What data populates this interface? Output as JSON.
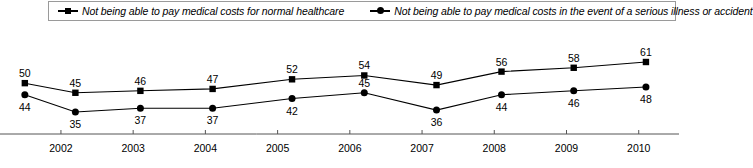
{
  "legend": {
    "entries": [
      {
        "label": "Not being able to pay medical costs for normal healthcare",
        "marker": "square-marker-icon"
      },
      {
        "label": "Not being able to pay medical costs in the event of a serious illness or accident",
        "marker": "circle-marker-icon"
      }
    ]
  },
  "chart_data": {
    "type": "line",
    "title": "",
    "xlabel": "",
    "ylabel": "",
    "grid": false,
    "legend_position": "top",
    "ylim": [
      30,
      65
    ],
    "x": [
      2001.5,
      2002.2,
      2003.1,
      2004.1,
      2005.2,
      2006.2,
      2007.2,
      2008.1,
      2009.1,
      2010.1
    ],
    "categories": [
      "",
      "2002",
      "2003",
      "2004",
      "2005",
      "2006",
      "2007",
      "2008",
      "2009",
      "2010"
    ],
    "xtick_labels": [
      "2002",
      "2003",
      "2004",
      "2005",
      "2006",
      "2007",
      "2008",
      "2009",
      "2010"
    ],
    "series": [
      {
        "name": "Not being able to pay medical costs for normal healthcare",
        "marker": "square",
        "values": [
          50,
          45,
          46,
          47,
          52,
          54,
          49,
          56,
          58,
          61
        ]
      },
      {
        "name": "Not being able to pay medical costs in the event of a serious illness or accident",
        "marker": "circle",
        "values": [
          44,
          35,
          37,
          37,
          42,
          45,
          36,
          44,
          46,
          48
        ]
      }
    ],
    "colors": {
      "line": "#000000",
      "axis": "#555555",
      "legend_border": "#9a9a9a"
    }
  }
}
